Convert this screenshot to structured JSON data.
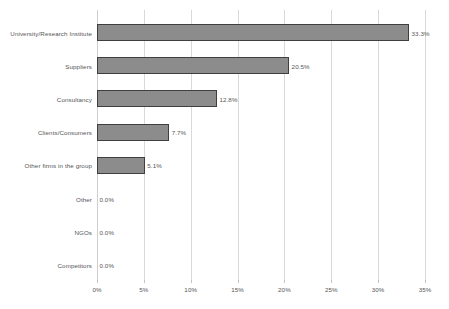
{
  "chart_data": {
    "type": "bar",
    "orientation": "horizontal",
    "title": "",
    "subtitle": "",
    "xlabel": "",
    "ylabel": "",
    "xlim": [
      0,
      35
    ],
    "xtick_values": [
      0,
      5,
      10,
      15,
      20,
      25,
      30,
      35
    ],
    "xtick_labels": [
      "0%",
      "5%",
      "10%",
      "15%",
      "20%",
      "25%",
      "30%",
      "35%"
    ],
    "grid": true,
    "legend": false,
    "legend_position": "none",
    "categories": [
      "University/Research Institute",
      "Suppliers",
      "Consultancy",
      "Clients/Consumers",
      "Other firms in the group",
      "Other",
      "NGOs",
      "Competitors"
    ],
    "values": [
      33.3,
      20.5,
      12.8,
      7.7,
      5.1,
      0.0,
      0.0,
      0.0
    ],
    "data_labels": [
      "33.3%",
      "20.5%",
      "12.8%",
      "7.7%",
      "5.1%",
      "0.0%",
      "0.0%",
      "0.0%"
    ],
    "colors": {
      "bar_fill": "#8c8c8c",
      "bar_border": "#3f3f3f",
      "gridline": "#d9d9d9",
      "text": "#555555",
      "background": "#ffffff"
    }
  }
}
